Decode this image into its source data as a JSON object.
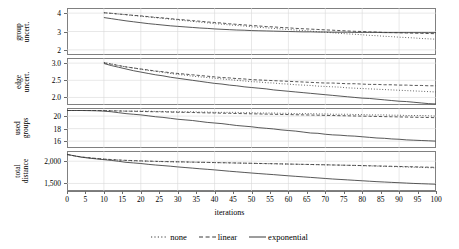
{
  "figure": {
    "width": 459,
    "height": 249,
    "xlabel": "iterations",
    "axis_color": "#6b6b6b",
    "grid_color": "#d8d8d8",
    "series_color": "#3a3a3a"
  },
  "legend": {
    "position": "bottom-center",
    "items": [
      {
        "label": "none",
        "style": "dotted",
        "name": "legend-item-none"
      },
      {
        "label": "linear",
        "style": "dashed",
        "name": "legend-item-linear"
      },
      {
        "label": "exponential",
        "style": "solid",
        "name": "legend-item-exponential"
      }
    ]
  },
  "xaxis": {
    "min": 0,
    "max": 100,
    "ticks": [
      0,
      5,
      10,
      15,
      20,
      25,
      30,
      35,
      40,
      45,
      50,
      55,
      60,
      65,
      70,
      75,
      80,
      85,
      90,
      95,
      100
    ],
    "tick_labels": [
      "0",
      "5",
      "10",
      "15",
      "20",
      "25",
      "30",
      "35",
      "40",
      "45",
      "50",
      "55",
      "60",
      "65",
      "70",
      "75",
      "80",
      "85",
      "90",
      "95",
      "100"
    ]
  },
  "chart_data": [
    {
      "type": "line",
      "panel": 1,
      "title": "",
      "ylabel": "group\nuncert.",
      "ylabel_lines": [
        "group",
        "uncert."
      ],
      "xlabel": "iterations",
      "xlim": [
        0,
        100
      ],
      "ylim": [
        1.72,
        4.28
      ],
      "yticks": [
        2,
        3,
        4
      ],
      "ytick_labels": [
        "2",
        "3",
        "4"
      ],
      "grid": true,
      "x": [
        10,
        12,
        14,
        16,
        18,
        20,
        22,
        24,
        26,
        28,
        30,
        32,
        34,
        36,
        38,
        40,
        42,
        44,
        46,
        48,
        50,
        52,
        54,
        56,
        58,
        60,
        62,
        64,
        66,
        68,
        70,
        72,
        74,
        76,
        78,
        80,
        82,
        84,
        86,
        88,
        90,
        92,
        94,
        96,
        98,
        100
      ],
      "series": [
        {
          "name": "none",
          "style": "dotted",
          "values": [
            4.02,
            3.99,
            3.95,
            3.91,
            3.87,
            3.83,
            3.79,
            3.75,
            3.71,
            3.67,
            3.63,
            3.59,
            3.55,
            3.51,
            3.47,
            3.43,
            3.4,
            3.36,
            3.33,
            3.3,
            3.26,
            3.23,
            3.2,
            3.17,
            3.14,
            3.11,
            3.08,
            3.05,
            3.02,
            2.99,
            2.96,
            2.93,
            2.9,
            2.87,
            2.85,
            2.82,
            2.79,
            2.77,
            2.74,
            2.72,
            2.69,
            2.67,
            2.65,
            2.62,
            2.6,
            2.58
          ]
        },
        {
          "name": "linear",
          "style": "dashed",
          "values": [
            4.02,
            3.99,
            3.95,
            3.92,
            3.88,
            3.85,
            3.81,
            3.77,
            3.74,
            3.7,
            3.66,
            3.63,
            3.59,
            3.56,
            3.52,
            3.49,
            3.46,
            3.42,
            3.39,
            3.36,
            3.33,
            3.3,
            3.27,
            3.25,
            3.22,
            3.2,
            3.17,
            3.15,
            3.13,
            3.11,
            3.09,
            3.07,
            3.05,
            3.03,
            3.01,
            3.0,
            2.98,
            2.97,
            2.95,
            2.94,
            2.93,
            2.92,
            2.91,
            2.9,
            2.89,
            2.88
          ]
        },
        {
          "name": "exponential",
          "style": "solid",
          "values": [
            3.76,
            3.7,
            3.64,
            3.58,
            3.53,
            3.48,
            3.43,
            3.39,
            3.35,
            3.31,
            3.28,
            3.25,
            3.22,
            3.19,
            3.17,
            3.14,
            3.12,
            3.1,
            3.08,
            3.07,
            3.05,
            3.04,
            3.03,
            3.02,
            3.01,
            3.0,
            2.99,
            2.98,
            2.98,
            2.97,
            2.97,
            2.96,
            2.96,
            2.96,
            2.95,
            2.95,
            2.95,
            2.95,
            2.94,
            2.94,
            2.94,
            2.94,
            2.94,
            2.94,
            2.94,
            2.94
          ]
        }
      ]
    },
    {
      "type": "line",
      "panel": 2,
      "title": "",
      "ylabel": "edge\nuncert.",
      "ylabel_lines": [
        "edge",
        "uncert."
      ],
      "xlabel": "iterations",
      "xlim": [
        0,
        100
      ],
      "ylim": [
        1.78,
        3.15
      ],
      "yticks": [
        2.0,
        2.5,
        3.0
      ],
      "ytick_labels": [
        "2.0",
        "2.5",
        "3.0"
      ],
      "grid": true,
      "x": [
        10,
        12,
        14,
        16,
        18,
        20,
        22,
        24,
        26,
        28,
        30,
        32,
        34,
        36,
        38,
        40,
        42,
        44,
        46,
        48,
        50,
        52,
        54,
        56,
        58,
        60,
        62,
        64,
        66,
        68,
        70,
        72,
        74,
        76,
        78,
        80,
        82,
        84,
        86,
        88,
        90,
        92,
        94,
        96,
        98,
        100
      ],
      "series": [
        {
          "name": "none",
          "style": "dotted",
          "values": [
            3.02,
            2.98,
            2.93,
            2.89,
            2.86,
            2.82,
            2.79,
            2.76,
            2.73,
            2.7,
            2.67,
            2.65,
            2.62,
            2.6,
            2.58,
            2.56,
            2.54,
            2.52,
            2.5,
            2.48,
            2.46,
            2.45,
            2.43,
            2.42,
            2.4,
            2.39,
            2.37,
            2.36,
            2.35,
            2.33,
            2.32,
            2.31,
            2.3,
            2.28,
            2.27,
            2.26,
            2.25,
            2.24,
            2.23,
            2.22,
            2.21,
            2.2,
            2.19,
            2.18,
            2.17,
            2.16
          ]
        },
        {
          "name": "linear",
          "style": "dashed",
          "values": [
            3.01,
            2.97,
            2.93,
            2.89,
            2.86,
            2.83,
            2.8,
            2.77,
            2.75,
            2.72,
            2.7,
            2.68,
            2.66,
            2.64,
            2.62,
            2.6,
            2.58,
            2.57,
            2.55,
            2.54,
            2.52,
            2.51,
            2.5,
            2.49,
            2.48,
            2.47,
            2.46,
            2.45,
            2.44,
            2.43,
            2.42,
            2.42,
            2.41,
            2.4,
            2.4,
            2.39,
            2.38,
            2.38,
            2.37,
            2.37,
            2.36,
            2.36,
            2.35,
            2.35,
            2.34,
            2.34
          ]
        },
        {
          "name": "exponential",
          "style": "solid",
          "values": [
            2.99,
            2.93,
            2.88,
            2.83,
            2.78,
            2.74,
            2.7,
            2.66,
            2.63,
            2.59,
            2.56,
            2.53,
            2.5,
            2.47,
            2.44,
            2.41,
            2.39,
            2.36,
            2.34,
            2.31,
            2.29,
            2.27,
            2.25,
            2.22,
            2.2,
            2.18,
            2.16,
            2.14,
            2.12,
            2.1,
            2.08,
            2.06,
            2.04,
            2.02,
            2.0,
            1.98,
            1.97,
            1.95,
            1.93,
            1.91,
            1.89,
            1.88,
            1.86,
            1.84,
            1.82,
            1.81
          ]
        }
      ]
    },
    {
      "type": "line",
      "panel": 3,
      "title": "",
      "ylabel": "used\ngroups",
      "ylabel_lines": [
        "used",
        "groups"
      ],
      "xlabel": "iterations",
      "xlim": [
        0,
        100
      ],
      "ylim": [
        14.9,
        21.3
      ],
      "yticks": [
        16,
        18,
        20
      ],
      "ytick_labels": [
        "16",
        "18",
        "20"
      ],
      "grid": true,
      "x": [
        0,
        2,
        4,
        6,
        8,
        10,
        12,
        14,
        16,
        18,
        20,
        22,
        24,
        26,
        28,
        30,
        32,
        34,
        36,
        38,
        40,
        42,
        44,
        46,
        48,
        50,
        52,
        54,
        56,
        58,
        60,
        62,
        64,
        66,
        68,
        70,
        72,
        74,
        76,
        78,
        80,
        82,
        84,
        86,
        88,
        90,
        92,
        94,
        96,
        98,
        100
      ],
      "series": [
        {
          "name": "none",
          "style": "dotted",
          "values": [
            20.9,
            20.9,
            20.9,
            20.9,
            20.9,
            20.9,
            20.85,
            20.85,
            20.8,
            20.8,
            20.8,
            20.8,
            20.75,
            20.75,
            20.7,
            20.7,
            20.7,
            20.7,
            20.65,
            20.65,
            20.6,
            20.6,
            20.6,
            20.6,
            20.55,
            20.55,
            20.5,
            20.5,
            20.5,
            20.45,
            20.45,
            20.4,
            20.4,
            20.4,
            20.35,
            20.35,
            20.3,
            20.3,
            20.3,
            20.25,
            20.25,
            20.2,
            20.2,
            20.2,
            20.15,
            20.15,
            20.1,
            20.1,
            20.1,
            20.05,
            20.0
          ]
        },
        {
          "name": "linear",
          "style": "dashed",
          "values": [
            20.9,
            20.9,
            20.9,
            20.9,
            20.9,
            20.88,
            20.85,
            20.82,
            20.8,
            20.78,
            20.75,
            20.72,
            20.7,
            20.68,
            20.65,
            20.62,
            20.6,
            20.58,
            20.55,
            20.52,
            20.5,
            20.47,
            20.45,
            20.42,
            20.4,
            20.37,
            20.35,
            20.32,
            20.3,
            20.27,
            20.25,
            20.22,
            20.2,
            20.17,
            20.15,
            20.12,
            20.1,
            20.07,
            20.05,
            20.02,
            20.0,
            19.97,
            19.95,
            19.92,
            19.9,
            19.87,
            19.85,
            19.82,
            19.8,
            19.78,
            19.75
          ]
        },
        {
          "name": "exponential",
          "style": "solid",
          "values": [
            20.9,
            20.9,
            20.9,
            20.88,
            20.85,
            20.8,
            20.7,
            20.55,
            20.4,
            20.3,
            20.2,
            20.05,
            19.9,
            19.8,
            19.65,
            19.5,
            19.4,
            19.3,
            19.15,
            19.0,
            18.9,
            18.8,
            18.65,
            18.5,
            18.4,
            18.3,
            18.15,
            18.05,
            17.95,
            17.8,
            17.7,
            17.6,
            17.45,
            17.3,
            17.25,
            17.1,
            17.0,
            16.95,
            16.85,
            16.8,
            16.7,
            16.6,
            16.5,
            16.45,
            16.35,
            16.3,
            16.2,
            16.15,
            16.1,
            16.05,
            16.0
          ]
        }
      ]
    },
    {
      "type": "line",
      "panel": 4,
      "title": "",
      "ylabel": "total\ndistance",
      "ylabel_lines": [
        "total",
        "distance"
      ],
      "xlabel": "iterations",
      "xlim": [
        0,
        100
      ],
      "ylim": [
        1330,
        2230
      ],
      "yticks": [
        1500,
        2000
      ],
      "ytick_labels": [
        "1,500",
        "2,000"
      ],
      "grid": true,
      "x": [
        0,
        2,
        4,
        6,
        8,
        10,
        12,
        14,
        16,
        18,
        20,
        22,
        24,
        26,
        28,
        30,
        32,
        34,
        36,
        38,
        40,
        42,
        44,
        46,
        48,
        50,
        52,
        54,
        56,
        58,
        60,
        62,
        64,
        66,
        68,
        70,
        72,
        74,
        76,
        78,
        80,
        82,
        84,
        86,
        88,
        90,
        92,
        94,
        96,
        98,
        100
      ],
      "series": [
        {
          "name": "none",
          "style": "dotted",
          "values": [
            2150,
            2120,
            2090,
            2075,
            2060,
            2045,
            2035,
            2025,
            2015,
            2010,
            2005,
            2000,
            1995,
            1990,
            1988,
            1985,
            1982,
            1978,
            1975,
            1972,
            1968,
            1965,
            1962,
            1958,
            1955,
            1952,
            1948,
            1945,
            1942,
            1938,
            1935,
            1932,
            1928,
            1925,
            1922,
            1918,
            1915,
            1912,
            1908,
            1905,
            1900,
            1895,
            1890,
            1885,
            1880,
            1875,
            1870,
            1865,
            1860,
            1855,
            1850
          ]
        },
        {
          "name": "linear",
          "style": "dashed",
          "values": [
            2150,
            2122,
            2095,
            2078,
            2062,
            2048,
            2038,
            2028,
            2020,
            2014,
            2008,
            2003,
            1998,
            1994,
            1990,
            1987,
            1984,
            1980,
            1977,
            1974,
            1970,
            1967,
            1964,
            1960,
            1957,
            1954,
            1950,
            1947,
            1944,
            1940,
            1937,
            1933,
            1930,
            1927,
            1923,
            1920,
            1916,
            1913,
            1909,
            1906,
            1902,
            1898,
            1894,
            1890,
            1886,
            1882,
            1878,
            1874,
            1870,
            1866,
            1862
          ]
        },
        {
          "name": "exponential",
          "style": "solid",
          "values": [
            2155,
            2120,
            2090,
            2070,
            2052,
            2035,
            2018,
            1998,
            1975,
            1962,
            1948,
            1930,
            1915,
            1902,
            1888,
            1872,
            1858,
            1845,
            1830,
            1818,
            1805,
            1790,
            1775,
            1762,
            1748,
            1735,
            1722,
            1710,
            1698,
            1685,
            1672,
            1660,
            1648,
            1636,
            1624,
            1612,
            1600,
            1590,
            1580,
            1570,
            1560,
            1550,
            1540,
            1532,
            1524,
            1516,
            1508,
            1500,
            1494,
            1488,
            1482
          ]
        }
      ]
    }
  ]
}
